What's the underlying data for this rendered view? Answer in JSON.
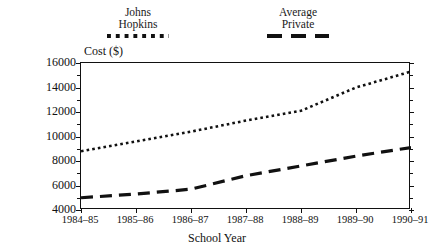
{
  "chart_data": {
    "type": "line",
    "title": "",
    "xlabel": "School Year",
    "ylabel": "Cost ($)",
    "categories": [
      "1984–85",
      "1985–86",
      "1986–87",
      "1987–88",
      "1988–89",
      "1989–90",
      "1990–91"
    ],
    "ylim": [
      4000,
      16000
    ],
    "ytick_labels": [
      "4000",
      "6000",
      "8000",
      "10000",
      "12000",
      "14000",
      "16000"
    ],
    "ytick_values": [
      4000,
      6000,
      8000,
      10000,
      12000,
      14000,
      16000
    ],
    "yminor_values": [
      5000,
      7000,
      9000,
      11000,
      13000,
      15000
    ],
    "grid": false,
    "legend_position": "above-plot",
    "series": [
      {
        "name": "Johns Hopkins",
        "name_line1": "Johns",
        "name_line2": "Hopkins",
        "style": "dotted",
        "color": "#111111",
        "values": [
          8800,
          9600,
          10400,
          11300,
          12100,
          14000,
          15300
        ]
      },
      {
        "name": "Average Private",
        "name_line1": "Average",
        "name_line2": "Private",
        "style": "dashed",
        "color": "#111111",
        "values": [
          5000,
          5300,
          5700,
          6800,
          7600,
          8400,
          9100
        ]
      }
    ]
  },
  "axes": {
    "y_axis_title": "Cost ($)",
    "x_axis_title": "School Year"
  }
}
